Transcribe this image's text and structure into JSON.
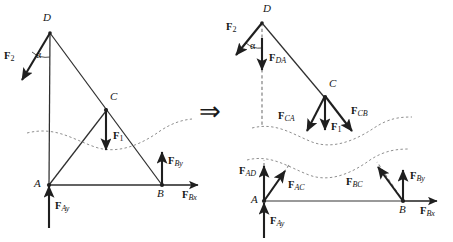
{
  "figure": {
    "title_visible": false,
    "background_color": "#ffffff",
    "stroke_color": "#2b2b2b",
    "dash_color": "#8a8a8a",
    "implication_symbol": "⇒"
  },
  "left_diagram": {
    "name": "original-truss-with-loads",
    "points": [
      {
        "id": "D",
        "label": "D",
        "x": 50,
        "y": 32
      },
      {
        "id": "C",
        "label": "C",
        "x": 106,
        "y": 110
      },
      {
        "id": "A",
        "label": "A",
        "x": 49,
        "y": 185
      },
      {
        "id": "B",
        "label": "B",
        "x": 162,
        "y": 185
      }
    ],
    "point_labels": [
      {
        "label": "D",
        "x": 43,
        "y": 14
      },
      {
        "label": "C",
        "x": 110,
        "y": 94
      },
      {
        "label": "A",
        "x": 36,
        "y": 180
      },
      {
        "label": "B",
        "x": 158,
        "y": 190
      }
    ],
    "members": [
      {
        "from": "D",
        "to": "A"
      },
      {
        "from": "D",
        "to": "B"
      },
      {
        "from": "A",
        "to": "C"
      },
      {
        "from": "A",
        "to": "B"
      }
    ],
    "angle_label": "α",
    "forces": [
      {
        "label_bold": "F",
        "label_sub": "2",
        "sub_italic": false,
        "at": "D",
        "direction": "down-left"
      },
      {
        "label_bold": "F",
        "label_sub": "1",
        "sub_italic": false,
        "at": "C",
        "direction": "down"
      },
      {
        "label_bold": "F",
        "label_sub": "Ay",
        "sub_italic": true,
        "at": "A",
        "direction": "up"
      },
      {
        "label_bold": "F",
        "label_sub": "By",
        "sub_italic": true,
        "at": "B",
        "direction": "up"
      },
      {
        "label_bold": "F",
        "label_sub": "Bx",
        "sub_italic": true,
        "at": "B",
        "direction": "right"
      }
    ],
    "section_cut": "dashed-wavy-curve"
  },
  "right_diagram": {
    "name": "sectioned-free-body-diagrams",
    "upper_section": {
      "points": [
        {
          "id": "D",
          "label": "D",
          "x": 262,
          "y": 22
        },
        {
          "id": "C",
          "label": "C",
          "x": 325,
          "y": 97
        }
      ],
      "point_labels": [
        {
          "label": "D",
          "x": 263,
          "y": 5
        },
        {
          "label": "C",
          "x": 329,
          "y": 81
        }
      ],
      "angle_label": "α",
      "forces": [
        {
          "label_bold": "F",
          "label_sub": "2",
          "sub_italic": false,
          "direction": "down-left"
        },
        {
          "label_bold": "F",
          "label_sub": "DA",
          "sub_italic": true,
          "direction": "down"
        },
        {
          "label_bold": "F",
          "label_sub": "CA",
          "sub_italic": true,
          "direction": "down-left"
        },
        {
          "label_bold": "F",
          "label_sub": "1",
          "sub_italic": false,
          "direction": "down"
        },
        {
          "label_bold": "F",
          "label_sub": "CB",
          "sub_italic": true,
          "direction": "down-right"
        }
      ]
    },
    "lower_section": {
      "points": [
        {
          "id": "A",
          "label": "A",
          "x": 264,
          "y": 201
        },
        {
          "id": "B",
          "label": "B",
          "x": 403,
          "y": 201
        }
      ],
      "point_labels": [
        {
          "label": "A",
          "x": 252,
          "y": 197
        },
        {
          "label": "B",
          "x": 400,
          "y": 207
        }
      ],
      "forces": [
        {
          "label_bold": "F",
          "label_sub": "AD",
          "sub_italic": true,
          "direction": "up"
        },
        {
          "label_bold": "F",
          "label_sub": "AC",
          "sub_italic": true,
          "direction": "up-right"
        },
        {
          "label_bold": "F",
          "label_sub": "Ay",
          "sub_italic": true,
          "direction": "up"
        },
        {
          "label_bold": "F",
          "label_sub": "BC",
          "sub_italic": true,
          "direction": "up-left"
        },
        {
          "label_bold": "F",
          "label_sub": "By",
          "sub_italic": true,
          "direction": "up"
        },
        {
          "label_bold": "F",
          "label_sub": "Bx",
          "sub_italic": true,
          "direction": "right"
        }
      ]
    }
  },
  "labels": {
    "D": "D",
    "C": "C",
    "A": "A",
    "B": "B",
    "alpha": "α",
    "implies": "⇒",
    "F": "F",
    "s1": "1",
    "s2": "2",
    "sAy": "Ay",
    "sBy": "By",
    "sBx": "Bx",
    "sDA": "DA",
    "sCA": "CA",
    "sCB": "CB",
    "sAD": "AD",
    "sAC": "AC",
    "sBC": "BC"
  }
}
